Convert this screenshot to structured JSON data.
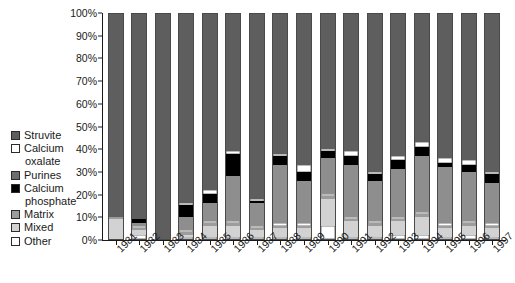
{
  "legend": {
    "items": [
      {
        "label": "Struvite",
        "color": "#5e5e5e",
        "cont": ""
      },
      {
        "label": "Calcium",
        "color": "#ffffff",
        "cont": "oxalate"
      },
      {
        "label": "Purines",
        "color": "#6e6e6e",
        "cont": ""
      },
      {
        "label": "Calcium",
        "color": "#000000",
        "cont": "phosphate"
      },
      {
        "label": "Matrix",
        "color": "#9c9c9c",
        "cont": ""
      },
      {
        "label": "Mixed",
        "color": "#d2d2d2",
        "cont": ""
      },
      {
        "label": "Other",
        "color": "#ffffff",
        "cont": ""
      }
    ]
  },
  "chart_data": {
    "type": "bar",
    "stacked": true,
    "title": "",
    "xlabel": "",
    "ylabel": "",
    "ylim": [
      0,
      100
    ],
    "ytick_labels": [
      "0%",
      "10%",
      "20%",
      "30%",
      "40%",
      "50%",
      "60%",
      "70%",
      "80%",
      "90%",
      "100%"
    ],
    "ytick_values": [
      0,
      10,
      20,
      30,
      40,
      50,
      60,
      70,
      80,
      90,
      100
    ],
    "grid": false,
    "legend_position": "left",
    "categories": [
      "1981",
      "1982",
      "1983",
      "1984",
      "1985",
      "1986",
      "1987",
      "1988",
      "1989",
      "1990",
      "1991",
      "1992",
      "1993",
      "1994",
      "1995",
      "1996",
      "1997"
    ],
    "series": [
      {
        "name": "Other",
        "color": "#ffffff",
        "values": [
          0,
          2,
          0,
          1,
          1,
          1,
          1,
          1,
          1,
          6,
          1,
          1,
          2,
          2,
          1,
          2,
          1
        ]
      },
      {
        "name": "Mixed",
        "color": "#d2d2d2",
        "values": [
          9,
          2,
          0,
          1,
          5,
          5,
          3,
          4,
          4,
          12,
          7,
          5,
          6,
          8,
          4,
          4,
          4
        ]
      },
      {
        "name": "Matrix",
        "color": "#9c9c9c",
        "values": [
          1,
          1,
          0,
          1,
          1,
          1,
          1,
          1,
          1,
          1,
          1,
          1,
          1,
          1,
          1,
          1,
          1
        ]
      },
      {
        "name": "Calcium oxalate",
        "color": "#ffffff",
        "values": [
          0,
          1,
          0,
          1,
          1,
          1,
          1,
          1,
          1,
          1,
          1,
          1,
          1,
          1,
          1,
          1,
          1
        ]
      },
      {
        "name": "Purines",
        "color": "#8e8e8e",
        "values": [
          0,
          1,
          0,
          6,
          8,
          20,
          10,
          26,
          19,
          16,
          23,
          18,
          21,
          25,
          25,
          22,
          18
        ]
      },
      {
        "name": "Calcium phosphate",
        "color": "#000000",
        "values": [
          0,
          2,
          0,
          5,
          4,
          10,
          1,
          4,
          4,
          3,
          4,
          3,
          4,
          4,
          2,
          3,
          4
        ]
      },
      {
        "name": "Calcium oxalate 2",
        "color": "#ffffff",
        "values": [
          0,
          0,
          0,
          1,
          2,
          1,
          1,
          1,
          3,
          1,
          2,
          1,
          2,
          2,
          2,
          2,
          1
        ]
      },
      {
        "name": "Struvite",
        "color": "#5e5e5e",
        "values": [
          90,
          91,
          100,
          84,
          78,
          61,
          82,
          62,
          67,
          60,
          61,
          70,
          63,
          57,
          64,
          65,
          70
        ]
      }
    ]
  }
}
